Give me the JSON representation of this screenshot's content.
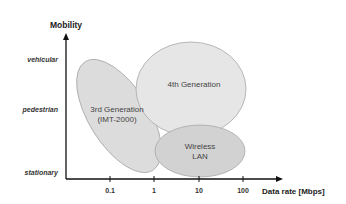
{
  "y_axis": {
    "title": "Mobility",
    "categories": [
      {
        "label": "vehicular",
        "y": 60
      },
      {
        "label": "pedestrian",
        "y": 110
      },
      {
        "label": "stationary",
        "y": 173
      }
    ]
  },
  "x_axis": {
    "title": "Data rate [Mbps]",
    "ticks": [
      {
        "label": "0.1",
        "x": 110
      },
      {
        "label": "1",
        "x": 154
      },
      {
        "label": "10",
        "x": 199
      },
      {
        "label": "100",
        "x": 243
      }
    ]
  },
  "regions": {
    "third_gen": {
      "line1": "3rd Generation",
      "line2": "(IMT-2000)",
      "fill": "#dcdcdc"
    },
    "fourth_gen": {
      "line1": "4th Generation",
      "fill": "#e6e6e6"
    },
    "wlan": {
      "line1": "Wireless",
      "line2": "LAN",
      "fill": "#d2d2d2"
    }
  },
  "colors": {
    "axis": "#111111",
    "ellipse_stroke": "#a8a8a8"
  }
}
